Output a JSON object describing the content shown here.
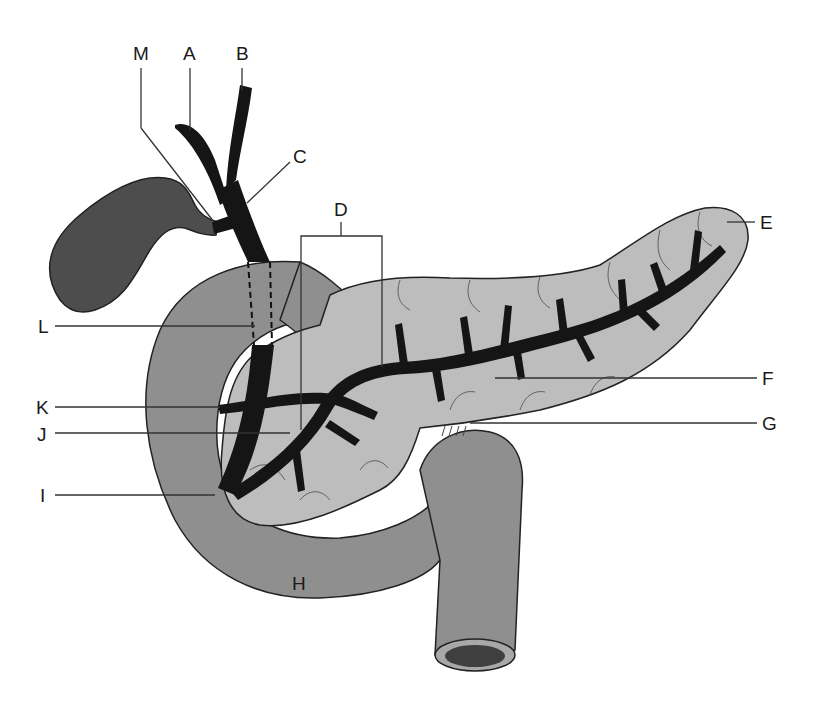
{
  "diagram": {
    "labels": {
      "A": "A",
      "B": "B",
      "C": "C",
      "D": "D",
      "E": "E",
      "F": "F",
      "G": "G",
      "H": "H",
      "I": "I",
      "J": "J",
      "K": "K",
      "L": "L",
      "M": "M"
    },
    "colors": {
      "duct": "#151515",
      "gallbladder": "#4d4d4d",
      "duodenum": "#8f8f8f",
      "pancreas": "#bdbdbd",
      "lumen": "#3f3f3f",
      "outline": "#222222",
      "background": "#ffffff"
    }
  }
}
